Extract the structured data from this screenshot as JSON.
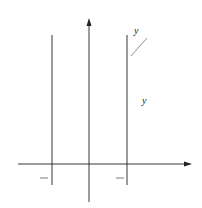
{
  "diagram": {
    "axes": {
      "x_label": "x",
      "y_label": "y",
      "origin_label": "0",
      "y_tick_label": "1"
    },
    "x_ticks": {
      "left": {
        "sign": "−",
        "num": "π",
        "den": "6"
      },
      "right": {
        "num": "π",
        "den": "6"
      }
    },
    "curves": [
      {
        "name": "sec-squared",
        "label_prefix": "y = sec",
        "sup": "2",
        "label_suffix": " x"
      },
      {
        "name": "tan-squared",
        "label_prefix": "y = tan",
        "sup": "2",
        "label_suffix": " x"
      }
    ],
    "shaded_region": "between y = sec^2 x and y = tan^2 x for -pi/6 <= x <= pi/6",
    "colors": {
      "ink": "#231f20",
      "background": "#ffffff"
    }
  }
}
